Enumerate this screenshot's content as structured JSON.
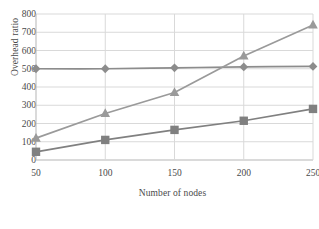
{
  "chart_data": {
    "type": "line",
    "title": "",
    "xlabel": "Number of nodes",
    "ylabel": "Overhead ratio",
    "x": [
      50,
      100,
      150,
      200,
      250
    ],
    "xlim": [
      50,
      250
    ],
    "ylim": [
      0,
      800
    ],
    "xticks": [
      "50",
      "100",
      "150",
      "200",
      "250"
    ],
    "yticks": [
      "0",
      "100",
      "200",
      "300",
      "400",
      "500",
      "600",
      "700",
      "800"
    ],
    "grid": "horizontal-and-vertical",
    "legend_position": "bottom",
    "series": [
      {
        "name": "Series 1",
        "marker": "diamond",
        "color": "#8c8c8c",
        "smooth": true,
        "values": [
          500,
          500,
          505,
          510,
          513
        ]
      },
      {
        "name": "Series 2",
        "marker": "triangle",
        "color": "#9a9a9a",
        "smooth": false,
        "values": [
          120,
          255,
          370,
          570,
          740
        ]
      },
      {
        "name": "Series 3",
        "marker": "square",
        "color": "#808080",
        "smooth": false,
        "values": [
          45,
          110,
          165,
          215,
          280
        ]
      }
    ]
  },
  "legend": {
    "entries": [
      {
        "label": ""
      },
      {
        "label": ""
      }
    ]
  },
  "colors": {
    "grid": "#d9d9d9",
    "axis": "#b5b5b5",
    "text": "#4a4a4a",
    "background": "#ffffff"
  }
}
